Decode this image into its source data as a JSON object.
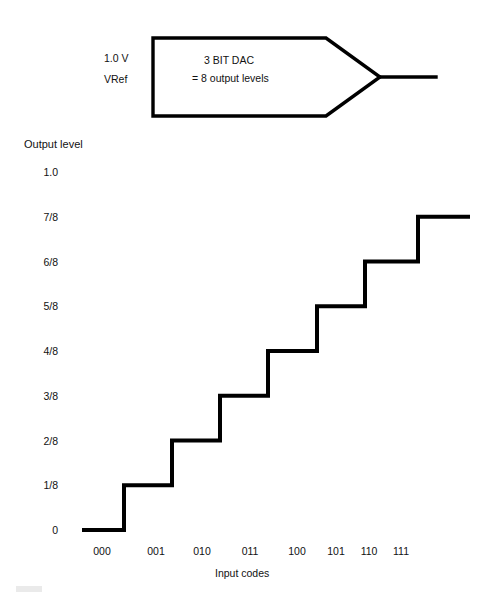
{
  "figure": {
    "title_block": {
      "vref_value": "1.0 V",
      "vref_name": "VRef",
      "device_name": "3 BIT DAC",
      "device_note": "= 8 output levels"
    },
    "axes": {
      "ylabel": "Output level",
      "xlabel": "Input codes"
    },
    "artifact_mark": ""
  },
  "chart_data": {
    "type": "line",
    "title": "",
    "subtitle": "",
    "xlabel": "Input codes",
    "ylabel": "Output level",
    "categories": [
      "000",
      "001",
      "010",
      "011",
      "100",
      "101",
      "110",
      "111"
    ],
    "values": [
      0,
      0.125,
      0.25,
      0.375,
      0.5,
      0.625,
      0.75,
      0.875
    ],
    "value_labels": [
      "0",
      "1/8",
      "2/8",
      "3/8",
      "4/8",
      "5/8",
      "6/8",
      "7/8"
    ],
    "ytick_labels": [
      "1.0",
      "7/8",
      "6/8",
      "5/8",
      "4/8",
      "3/8",
      "2/8",
      "1/8",
      "0"
    ],
    "ytick_values": [
      1.0,
      0.875,
      0.75,
      0.625,
      0.5,
      0.375,
      0.25,
      0.125,
      0
    ],
    "ylim": [
      0,
      1.0
    ],
    "grid": false,
    "legend": "none",
    "step_style": "staircase",
    "line_color": "#000000",
    "line_width": 4,
    "background": "#ffffff",
    "annotation": "Ideal 3-bit DAC transfer characteristic: 8 output levels from 0 to 7/8 of VRef"
  }
}
